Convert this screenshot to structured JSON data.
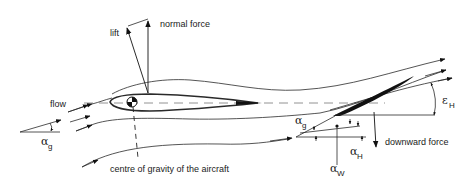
{
  "diagram": {
    "labels": {
      "lift": "lift",
      "normal_force": "normal force",
      "flow": "flow",
      "centre_of_gravity": "centre of gravity of the aircraft",
      "downward_force": "downward force"
    },
    "symbols": {
      "alpha": "α",
      "epsilon": "ε",
      "sub_g": "g",
      "sub_H": "H",
      "sub_W": "W"
    },
    "colors": {
      "stroke": "#2a2a2a",
      "background": "#ffffff",
      "tail_fill": "#111111"
    },
    "components": [
      "wing-airfoil",
      "centre-of-gravity-symbol",
      "horizontal-tail",
      "streamlines",
      "force-vectors",
      "angle-annotations"
    ]
  }
}
